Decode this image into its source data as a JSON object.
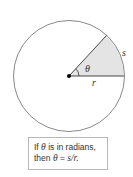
{
  "diagram": {
    "type": "circle-arc-radian-definition",
    "labels": {
      "angle": "θ",
      "arc": "s",
      "radius": "r"
    },
    "colors": {
      "circle_stroke": "#7a7a7a",
      "sector_fill": "#e4e4e4",
      "line": "#333333",
      "dot": "#000000"
    }
  },
  "caption": {
    "line1_prefix": "If ",
    "line1_theta": "θ",
    "line1_suffix": " is in radians,",
    "line2_prefix": "then ",
    "line2_theta": "θ",
    "line2_eq": " = ",
    "line2_formula": "s/r."
  }
}
